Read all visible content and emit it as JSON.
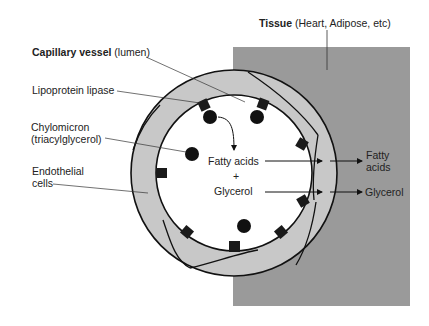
{
  "labels": {
    "capillary_bold": "Capillary vessel",
    "capillary_rest": " (lumen)",
    "lipase": "Lipoprotein lipase",
    "chylomicron_1": "Chylomicron",
    "chylomicron_2": "(triacylglycerol)",
    "endothelial_1": "Endothelial",
    "endothelial_2": "cells",
    "tissue_bold": "Tissue",
    "tissue_rest": " (Heart, Adipose, etc)",
    "fatty_acids_inner": "Fatty acids",
    "plus": "+",
    "glycerol_inner": "Glycerol",
    "fatty_outer_1": "Fatty",
    "fatty_outer_2": "acids",
    "glycerol_outer": "Glycerol"
  },
  "colors": {
    "tissue": "#9a9a9a",
    "endothelium": "#c8c8c8",
    "lumen": "#ffffff",
    "ink": "#111111"
  }
}
